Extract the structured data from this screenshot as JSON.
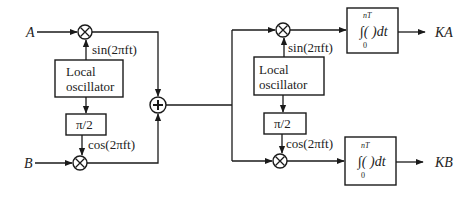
{
  "diagram": {
    "type": "QAM modulator / demodulator block diagram",
    "colors": {
      "line": "#1a1a1a",
      "text": "#222222",
      "background": "#ffffff"
    },
    "inputs": {
      "a": "A",
      "b": "B"
    },
    "outputs": {
      "ka": "KA",
      "kb": "KB"
    },
    "modulator": {
      "oscillator_line1": "Local",
      "oscillator_line2": "oscillator",
      "phase_shift": "π/2",
      "sin_label": "sin(2πft)",
      "cos_label": "cos(2πft)",
      "multiplier_symbol": "×",
      "adder_symbol": "+"
    },
    "demodulator": {
      "oscillator_line1": "Local",
      "oscillator_line2": "oscillator",
      "phase_shift": "π/2",
      "sin_label": "sin(2πft)",
      "cos_label": "cos(2πft)",
      "multiplier_symbol": "×",
      "integrator_top": {
        "upper_limit": "nT",
        "lower_limit": "0",
        "body": "∫( )dt"
      },
      "integrator_bottom": {
        "upper_limit": "nT",
        "lower_limit": "0",
        "body": "∫( )dt"
      }
    }
  }
}
